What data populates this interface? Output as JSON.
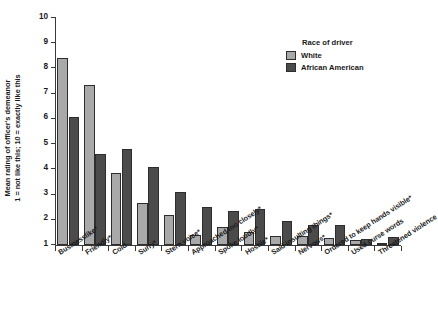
{
  "chart_data": {
    "type": "bar",
    "title": "",
    "xlabel": "",
    "ylabel": "Mean rating of officer's demeanor\n1 = not like this; 10 = exactly like this",
    "ylabel_line1": "Mean rating of officer's demeanor",
    "ylabel_line2": "1 = not like this; 10 = exactly like this",
    "ylim": [
      1,
      10
    ],
    "yticks": [
      1,
      2,
      3,
      4,
      5,
      6,
      7,
      8,
      9,
      10
    ],
    "ytick_labels": [
      "1",
      "2",
      "3",
      "4",
      "5",
      "6",
      "7",
      "8",
      "9",
      "10"
    ],
    "grid": false,
    "legend_position": "top-right",
    "legend_title": "Race of driver",
    "categories": [
      "Businesslike*",
      "Friendly*",
      "Cold",
      "Surly*",
      "Stern voice*",
      "Approached too closely*",
      "Spoke loudly*",
      "Hostile*",
      "Said insulting things*",
      "Nervous*",
      "Ordered to keep hands visible*",
      "Used curse words",
      "Threatened violence"
    ],
    "series": [
      {
        "name": "White",
        "color": "#a9a9a9",
        "values": [
          8.42,
          7.33,
          3.87,
          2.65,
          2.18,
          1.39,
          1.73,
          1.51,
          1.36,
          1.36,
          1.26,
          1.18,
          1.06
        ]
      },
      {
        "name": "African American",
        "color": "#4b4b4b",
        "values": [
          6.06,
          4.62,
          4.79,
          4.08,
          3.11,
          2.49,
          2.33,
          2.44,
          1.96,
          1.81,
          1.78,
          1.25,
          1.31
        ]
      }
    ],
    "footnote": "* indicates statistically significant difference"
  },
  "legend": {
    "title": "Race of driver",
    "entries": [
      {
        "label": "White",
        "color": "#a9a9a9"
      },
      {
        "label": "African American",
        "color": "#4b4b4b"
      }
    ]
  },
  "axis": {
    "y_title_line1": "Mean rating of officer's demeanor",
    "y_title_line2": "1 = not like this; 10 = exactly like this"
  }
}
